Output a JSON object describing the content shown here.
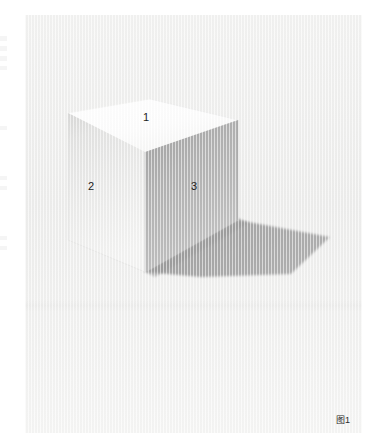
{
  "figure": {
    "caption": "图1",
    "background_color": "#ffffff",
    "panel_color": "#f1f1f0"
  },
  "cube": {
    "labels": [
      {
        "id": "1",
        "text": "1",
        "face": "top"
      },
      {
        "id": "2",
        "text": "2",
        "face": "left"
      },
      {
        "id": "3",
        "text": "3",
        "face": "right"
      }
    ],
    "face_colors": {
      "top": "#fdfdfd",
      "left": "#e9e9e8",
      "right": "#b4b4b4",
      "shadow": "#a9a9a9"
    }
  },
  "edge_marks": [
    {
      "top": 36,
      "height": 5
    },
    {
      "top": 46,
      "height": 5
    },
    {
      "top": 56,
      "height": 5
    },
    {
      "top": 66,
      "height": 4
    },
    {
      "top": 126,
      "height": 4
    },
    {
      "top": 176,
      "height": 4
    },
    {
      "top": 186,
      "height": 4
    },
    {
      "top": 236,
      "height": 4
    },
    {
      "top": 246,
      "height": 4
    }
  ]
}
